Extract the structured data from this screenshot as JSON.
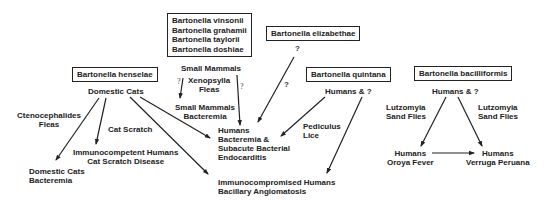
{
  "boxes": {
    "henselae": "Bartonella henselae",
    "small_mammal_species": [
      "Bartonella vinsonii",
      "Bartonella grahamii",
      "Bartonella taylorii",
      "Bartonella doshiae"
    ],
    "elizabethae": "Bartonella elizabethae",
    "quintana": "Bartonella quintana",
    "bacilliformis": "Bartonella bacilliformis"
  },
  "nodes": {
    "domestic_cats": "Domestic Cats",
    "ctenocephalides": [
      "Ctenocephalides",
      "Fleas"
    ],
    "cat_scratch": "Cat Scratch",
    "immunocompetent": [
      "Immunocompetent Humans",
      "Cat Scratch Disease"
    ],
    "domestic_cats_bacteremia": [
      "Domestic Cats",
      "Bacteremia"
    ],
    "small_mammals": "Small Mammals",
    "xenopsylla": [
      "Xenopsylla",
      "Fleas"
    ],
    "small_mammals_bacteremia": [
      "Small Mammals",
      "Bacteremia"
    ],
    "humans_endocarditis": [
      "Humans",
      "Bacteremia &",
      "Subacute Bacterial",
      "Endocarditis"
    ],
    "immunocompromised": [
      "Immunocompromised Humans",
      "Bacillary Angiomatosis"
    ],
    "quintana_host": "Humans & ?",
    "pediculus": [
      "Pediculus",
      "Lice"
    ],
    "bacilliformis_host": "Humans & ?",
    "lutzomyia_left": [
      "Lutzomyia",
      "Sand Flies"
    ],
    "lutzomyia_right": [
      "Lutzomyia",
      "Sand Flies"
    ],
    "oroya": [
      "Humans",
      "Oroya Fever"
    ],
    "verruga": [
      "Humans",
      "Verruga Peruana"
    ]
  },
  "question_marks": {
    "xenopsylla_left": "?",
    "small_mammals_right": "?",
    "elizabethae_top": "?",
    "elizabethae_mid": "?"
  },
  "colors": {
    "line": "#222222",
    "text": "#222222",
    "background": "#ffffff"
  }
}
